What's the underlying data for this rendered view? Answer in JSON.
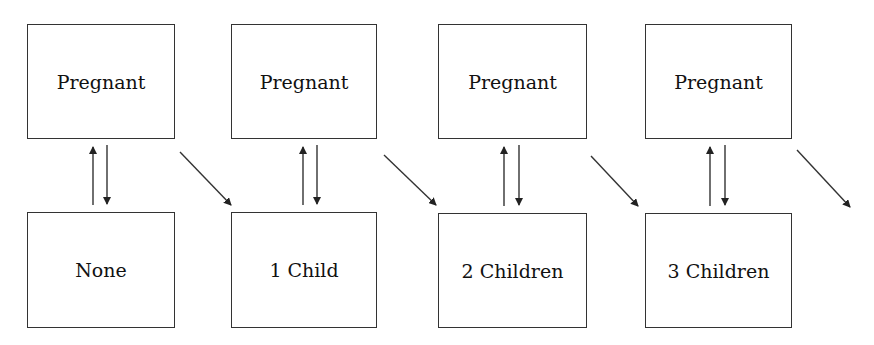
{
  "diagram": {
    "type": "state-transition",
    "top_row": [
      {
        "label": "Pregnant"
      },
      {
        "label": "Pregnant"
      },
      {
        "label": "Pregnant"
      },
      {
        "label": "Pregnant"
      }
    ],
    "bottom_row": [
      {
        "label": "None"
      },
      {
        "label": "1 Child"
      },
      {
        "label": "2 Children"
      },
      {
        "label": "3 Children"
      }
    ],
    "edges": [
      {
        "from": "None",
        "to": "Pregnant (1)",
        "kind": "up"
      },
      {
        "from": "Pregnant (1)",
        "to": "None",
        "kind": "down"
      },
      {
        "from": "Pregnant (1)",
        "to": "1 Child",
        "kind": "diagonal"
      },
      {
        "from": "1 Child",
        "to": "Pregnant (2)",
        "kind": "up"
      },
      {
        "from": "Pregnant (2)",
        "to": "1 Child",
        "kind": "down"
      },
      {
        "from": "Pregnant (2)",
        "to": "2 Children",
        "kind": "diagonal"
      },
      {
        "from": "2 Children",
        "to": "Pregnant (3)",
        "kind": "up"
      },
      {
        "from": "Pregnant (3)",
        "to": "2 Children",
        "kind": "down"
      },
      {
        "from": "Pregnant (3)",
        "to": "3 Children",
        "kind": "diagonal"
      },
      {
        "from": "3 Children",
        "to": "Pregnant (4)",
        "kind": "up"
      },
      {
        "from": "Pregnant (4)",
        "to": "3 Children",
        "kind": "down"
      },
      {
        "from": "Pregnant (4)",
        "to": "(continues)",
        "kind": "diagonal"
      }
    ],
    "colors": {
      "line": "#333333",
      "background": "#ffffff"
    }
  }
}
